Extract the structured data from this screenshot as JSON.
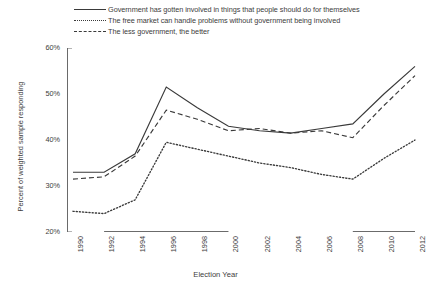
{
  "chart_data": {
    "type": "line",
    "title": "",
    "xlabel": "Election Year",
    "ylabel": "Percent of weighted sample responding",
    "x": [
      1990,
      1992,
      1994,
      1996,
      1998,
      2000,
      2002,
      2004,
      2006,
      2008,
      2010,
      2012
    ],
    "xtick_labels": [
      "1990",
      "1992",
      "1994",
      "1996",
      "1998",
      "2000",
      "2002",
      "2004",
      "2006",
      "2008",
      "2010",
      "2012"
    ],
    "ytick_labels": [
      "20%",
      "30%",
      "40%",
      "50%",
      "60%"
    ],
    "ytick_values": [
      20,
      30,
      40,
      50,
      60
    ],
    "ylim": [
      20,
      60
    ],
    "xlim": [
      1990,
      2012
    ],
    "grid": false,
    "legend_position": "top",
    "series": [
      {
        "name": "Government has gotten involved in things that people should do for themselves",
        "style": "solid",
        "color": "#3a3a3a",
        "values": [
          33.0,
          33.0,
          37.0,
          51.5,
          47.0,
          43.0,
          42.0,
          41.5,
          42.5,
          43.5,
          50.0,
          56.0
        ]
      },
      {
        "name": "The free market can handle problems without government being involved",
        "style": "dotted",
        "color": "#3a3a3a",
        "values": [
          24.5,
          24.0,
          27.0,
          39.5,
          38.0,
          36.5,
          35.0,
          34.0,
          32.5,
          31.5,
          36.0,
          40.0
        ]
      },
      {
        "name": "The less government, the better",
        "style": "dashed",
        "color": "#3a3a3a",
        "values": [
          31.5,
          32.0,
          36.5,
          46.5,
          44.5,
          42.0,
          42.5,
          41.5,
          42.0,
          40.5,
          47.5,
          54.0
        ]
      }
    ],
    "xaxis_highlight_spans": [
      {
        "start": 1992,
        "end": 2000
      },
      {
        "start": 2008,
        "end": 2012
      }
    ],
    "axis_color": "#6a6a6a"
  }
}
